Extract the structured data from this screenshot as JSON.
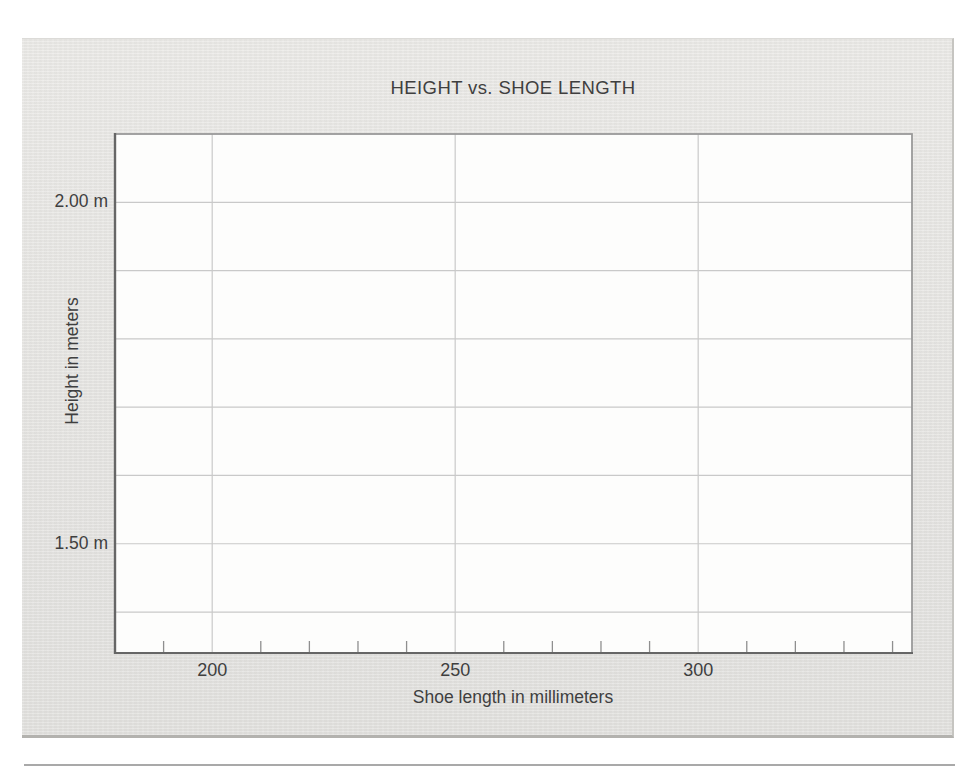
{
  "figure": {
    "panel_bg": "#e9e8e5",
    "divider_rule_color": "#a9a9a9"
  },
  "colors": {
    "plot_bg": "#fdfdfc",
    "gridline": "#c9c9c9",
    "plot_border": "#9a9a9a",
    "axis_line": "#666666",
    "minor_tick": "#8f8f8f",
    "text": "#3f3f3f"
  },
  "chart_data": {
    "type": "scatter",
    "title": "HEIGHT vs. SHOE LENGTH",
    "xlabel": "Shoe length in millimeters",
    "ylabel": "Height in meters",
    "grid": true,
    "legend": null,
    "series": [],
    "points": [],
    "x_axis": {
      "min": 180,
      "max": 344,
      "unit": "mm",
      "major_ticks": [
        200,
        250,
        300
      ],
      "tick_labels": [
        "200",
        "250",
        "300"
      ],
      "minor_tick_start": 190,
      "minor_tick_end": 340,
      "minor_tick_step": 10
    },
    "y_axis": {
      "min": 1.34,
      "max": 2.1,
      "unit": "m",
      "gridlines": [
        1.4,
        1.5,
        1.6,
        1.7,
        1.8,
        1.9,
        2.0
      ],
      "labeled_ticks": [
        {
          "value": 2.0,
          "label": "2.00 m"
        },
        {
          "value": 1.5,
          "label": "1.50 m"
        }
      ]
    }
  }
}
